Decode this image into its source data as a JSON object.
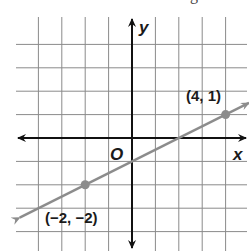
{
  "header_fragment": "g",
  "chart_data": {
    "type": "line",
    "title": "",
    "xlabel": "x",
    "ylabel": "y",
    "origin_label": "O",
    "xlim": [
      -4.5,
      5
    ],
    "ylim": [
      -4.5,
      5
    ],
    "grid": true,
    "grid_step": 1,
    "series": [
      {
        "name": "line",
        "equation": "y = 0.5x - 1",
        "slope": 0.5,
        "intercept": -1,
        "color": "#8c8c8c",
        "x": [
          -4.8,
          5
        ],
        "y": [
          -3.4,
          1.5
        ]
      }
    ],
    "points": [
      {
        "x": -2,
        "y": -2,
        "label": "(−2, −2)",
        "color": "#8c8c8c"
      },
      {
        "x": 4,
        "y": 1,
        "label": "(4, 1)",
        "color": "#8c8c8c"
      }
    ],
    "annotations": [
      "(−2, −2)",
      "(4, 1)"
    ]
  },
  "colors": {
    "grid": "#8a8a8a",
    "axes": "#111111",
    "line": "#8c8c8c",
    "text": "#1a1a1a"
  }
}
